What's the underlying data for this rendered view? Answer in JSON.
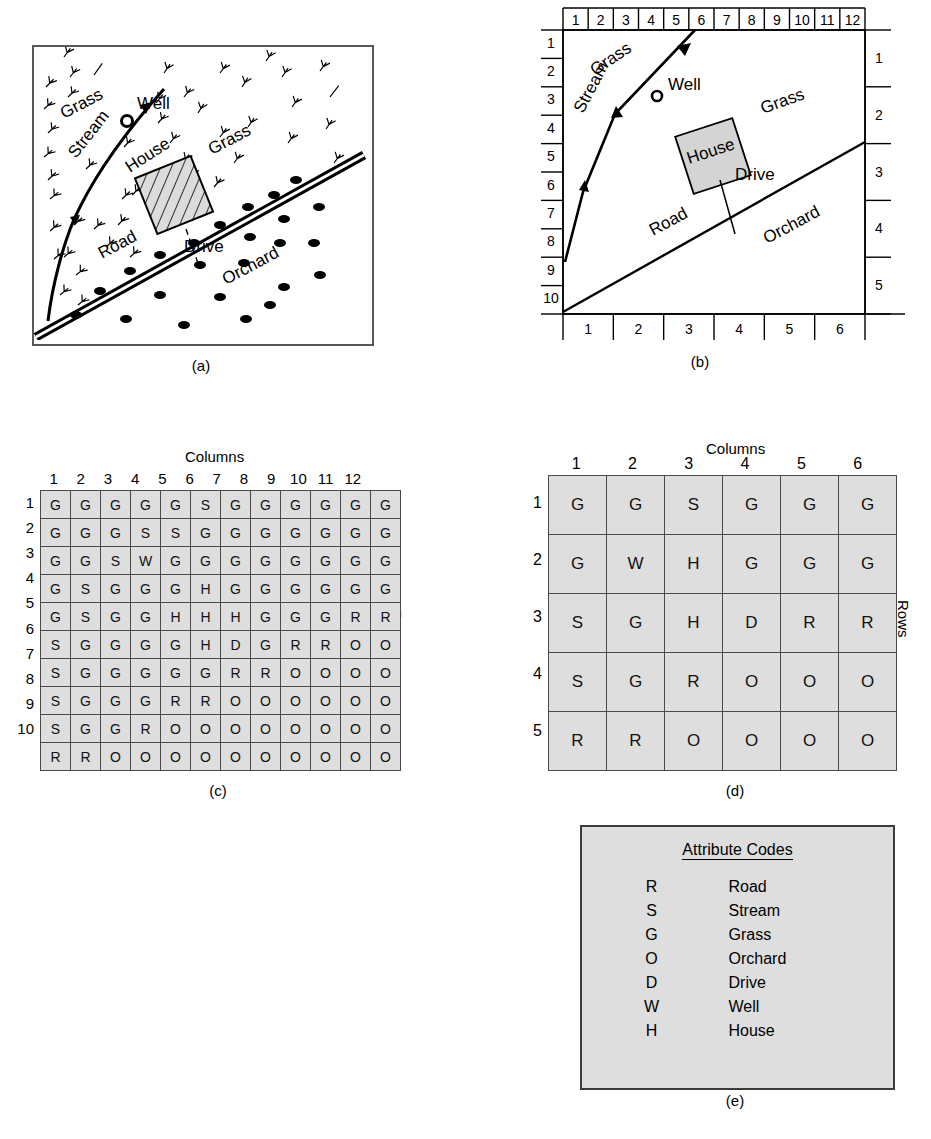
{
  "figure": {
    "captions": {
      "a": "(a)",
      "b": "(b)",
      "c": "(c)",
      "d": "(d)",
      "e": "(e)"
    },
    "colors": {
      "cell_fill": "#dedede",
      "cell_border": "#4a4a4a",
      "line": "#000000",
      "panel_border": "#55575a"
    }
  },
  "panel_a": {
    "labels": {
      "grass_upper_left": "Grass",
      "grass_right": "Grass",
      "stream": "Stream",
      "well": "Well",
      "house": "House",
      "drive": "Drive",
      "road": "Road",
      "orchard": "Orchard"
    }
  },
  "panel_b": {
    "top_axis_ticks": [
      "1",
      "2",
      "3",
      "4",
      "5",
      "6",
      "7",
      "8",
      "9",
      "10",
      "11",
      "12"
    ],
    "left_axis_ticks": [
      "1",
      "2",
      "3",
      "4",
      "5",
      "6",
      "7",
      "8",
      "9",
      "10"
    ],
    "right_axis_ticks": [
      "1",
      "2",
      "3",
      "4",
      "5"
    ],
    "bottom_axis_ticks": [
      "1",
      "2",
      "3",
      "4",
      "5",
      "6"
    ],
    "labels": {
      "grass_upper_left": "Grass",
      "grass_right": "Grass",
      "stream": "Stream",
      "well": "Well",
      "house": "House",
      "drive": "Drive",
      "road": "Road",
      "orchard": "Orchard"
    }
  },
  "chart_data": [
    {
      "type": "table",
      "id": "grid_c",
      "title": "",
      "xlabel": "Columns",
      "ylabel": "Rows",
      "columns": [
        "1",
        "2",
        "3",
        "4",
        "5",
        "6",
        "7",
        "8",
        "9",
        "10",
        "11",
        "12"
      ],
      "rows": [
        "1",
        "2",
        "3",
        "4",
        "5",
        "6",
        "7",
        "8",
        "9",
        "10"
      ],
      "values": [
        [
          "G",
          "G",
          "G",
          "G",
          "G",
          "S",
          "G",
          "G",
          "G",
          "G",
          "G",
          "G"
        ],
        [
          "G",
          "G",
          "G",
          "S",
          "S",
          "G",
          "G",
          "G",
          "G",
          "G",
          "G",
          "G"
        ],
        [
          "G",
          "G",
          "S",
          "W",
          "G",
          "G",
          "G",
          "G",
          "G",
          "G",
          "G",
          "G"
        ],
        [
          "G",
          "S",
          "G",
          "G",
          "G",
          "H",
          "G",
          "G",
          "G",
          "G",
          "G",
          "G"
        ],
        [
          "G",
          "S",
          "G",
          "G",
          "H",
          "H",
          "H",
          "G",
          "G",
          "G",
          "R",
          "R"
        ],
        [
          "S",
          "G",
          "G",
          "G",
          "G",
          "H",
          "D",
          "G",
          "R",
          "R",
          "O",
          "O"
        ],
        [
          "S",
          "G",
          "G",
          "G",
          "G",
          "G",
          "R",
          "R",
          "O",
          "O",
          "O",
          "O"
        ],
        [
          "S",
          "G",
          "G",
          "G",
          "R",
          "R",
          "O",
          "O",
          "O",
          "O",
          "O",
          "O"
        ],
        [
          "S",
          "G",
          "G",
          "R",
          "O",
          "O",
          "O",
          "O",
          "O",
          "O",
          "O",
          "O"
        ],
        [
          "R",
          "R",
          "O",
          "O",
          "O",
          "O",
          "O",
          "O",
          "O",
          "O",
          "O",
          "O"
        ]
      ]
    },
    {
      "type": "table",
      "id": "grid_d",
      "title": "",
      "xlabel": "Columns",
      "ylabel": "Rows",
      "columns": [
        "1",
        "2",
        "3",
        "4",
        "5",
        "6"
      ],
      "rows": [
        "1",
        "2",
        "3",
        "4",
        "5"
      ],
      "values": [
        [
          "G",
          "G",
          "S",
          "G",
          "G",
          "G"
        ],
        [
          "G",
          "W",
          "H",
          "G",
          "G",
          "G"
        ],
        [
          "S",
          "G",
          "H",
          "D",
          "R",
          "R"
        ],
        [
          "S",
          "G",
          "R",
          "O",
          "O",
          "O"
        ],
        [
          "R",
          "R",
          "O",
          "O",
          "O",
          "O"
        ]
      ]
    }
  ],
  "legend": {
    "title": "Attribute Codes",
    "entries": [
      {
        "code": "R",
        "name": "Road"
      },
      {
        "code": "S",
        "name": "Stream"
      },
      {
        "code": "G",
        "name": "Grass"
      },
      {
        "code": "O",
        "name": "Orchard"
      },
      {
        "code": "D",
        "name": "Drive"
      },
      {
        "code": "W",
        "name": "Well"
      },
      {
        "code": "H",
        "name": "House"
      }
    ]
  }
}
